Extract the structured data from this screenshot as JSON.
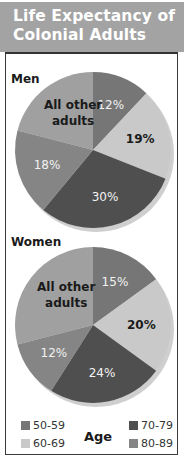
{
  "header": {
    "title_line1": "Life Expectancy of",
    "title_line2": "Colonial Adults"
  },
  "colors": {
    "50-59": "#767676",
    "60-69": "#c9c9c9",
    "70-79": "#4f4f4f",
    "80-89": "#858585",
    "other": "#a0a0a0"
  },
  "legend": {
    "title": "Age",
    "items": [
      {
        "label": "50-59",
        "key": "50-59"
      },
      {
        "label": "60-69",
        "key": "60-69"
      },
      {
        "label": "70-79",
        "key": "70-79"
      },
      {
        "label": "80-89",
        "key": "80-89"
      }
    ]
  },
  "chart_data": [
    {
      "type": "pie",
      "title": "Men",
      "categories": [
        "50-59",
        "60-69",
        "70-79",
        "80-89",
        "All other adults"
      ],
      "values": [
        12,
        19,
        30,
        18,
        21
      ],
      "labels": [
        "12%",
        "19%",
        "30%",
        "18%",
        "All other adults"
      ],
      "legend_title": "Age"
    },
    {
      "type": "pie",
      "title": "Women",
      "categories": [
        "50-59",
        "60-69",
        "70-79",
        "80-89",
        "All other adults"
      ],
      "values": [
        15,
        20,
        24,
        12,
        29
      ],
      "labels": [
        "15%",
        "20%",
        "24%",
        "12%",
        "All other adults"
      ],
      "legend_title": "Age"
    }
  ]
}
